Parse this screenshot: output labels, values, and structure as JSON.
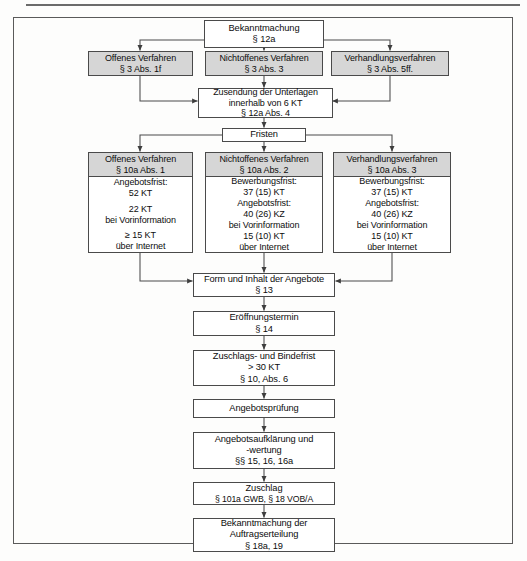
{
  "document": {
    "type": "flowchart",
    "language": "de",
    "title": "Vergabeverfahren Ablaufdiagramm"
  },
  "nodes": {
    "bekanntmachung": {
      "lines": [
        "Bekanntmachung",
        "§ 12a"
      ]
    },
    "offenes_verfahren_top": {
      "lines": [
        "Offenes Verfahren",
        "§ 3 Abs. 1f"
      ]
    },
    "nichtoffenes_verfahren_top": {
      "lines": [
        "Nichtoffenes Verfahren",
        "§ 3 Abs. 3"
      ]
    },
    "verhandlungsverfahren_top": {
      "lines": [
        "Verhandlungsverfahren",
        "§ 3 Abs. 5ff."
      ]
    },
    "zusendung": {
      "lines": [
        "Zusendung der Unterlagen",
        "innerhalb von 6 KT",
        "§ 12a Abs. 4"
      ]
    },
    "fristen": {
      "lines": [
        "Fristen"
      ]
    },
    "offenes_verfahren_head": {
      "lines": [
        "Offenes Verfahren",
        "§ 10a Abs. 1"
      ]
    },
    "offenes_verfahren_body": {
      "groups": [
        [
          "Angebotsfrist:",
          "52 KT"
        ],
        [
          "22 KT",
          "bei Vorinformation"
        ],
        [
          "≥ 15 KT",
          "über Internet"
        ]
      ]
    },
    "nichtoffenes_verfahren_head": {
      "lines": [
        "Nichtoffenes Verfahren",
        "§ 10a Abs. 2"
      ]
    },
    "nichtoffenes_verfahren_body": {
      "groups": [
        [
          "Bewerbungsfrist:",
          "37 (15) KT"
        ],
        [
          "Angebotsfrist:",
          "40 (26) KZ",
          "bei Vorinformation"
        ],
        [
          "15 (10) KT",
          "über Internet"
        ]
      ]
    },
    "verhandlungsverfahren_head": {
      "lines": [
        "Verhandlungsverfahren",
        "§ 10a Abs. 3"
      ]
    },
    "verhandlungsverfahren_body": {
      "groups": [
        [
          "Bewerbungsfrist:",
          "37 (15) KT"
        ],
        [
          "Angebotsfrist:",
          "40 (26) KZ",
          "bei Vorinformation"
        ],
        [
          "15 (10) KT",
          "über Internet"
        ]
      ]
    },
    "form_inhalt": {
      "lines": [
        "Form und Inhalt der Angebote",
        "§ 13"
      ]
    },
    "eroeffnungstermin": {
      "lines": [
        "Eröffnungstermin",
        "§ 14"
      ]
    },
    "zuschlags_bindefrist": {
      "lines": [
        "Zuschlags- und Bindefrist",
        "> 30 KT",
        "§ 10, Abs. 6"
      ]
    },
    "angebotspruefung": {
      "lines": [
        "Angebotsprüfung"
      ]
    },
    "aufklaerung_wertung": {
      "lines": [
        "Angebotsaufklärung und",
        "-wertung",
        "§§ 15, 16, 16a"
      ]
    },
    "zuschlag": {
      "lines": [
        "Zuschlag",
        "§ 101a GWB, § 18 VOB/A"
      ]
    },
    "bekanntmachung_auftrag": {
      "lines": [
        "Bekanntmachung der",
        "Auftragserteilung",
        "§ 18a, 19"
      ]
    }
  },
  "colors": {
    "header_fill": "#d6d6d6",
    "box_fill": "#ffffff",
    "line": "#4a4a4a",
    "frame": "#5a5a5a",
    "text": "#0d0d0d"
  }
}
